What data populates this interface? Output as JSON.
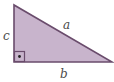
{
  "diagram": {
    "type": "right-triangle",
    "colors": {
      "fill": "#c8b4cc",
      "stroke": "#6a4c6c",
      "label": "#4a4a4a",
      "background": "#ffffff"
    },
    "vertices": {
      "top": [
        14,
        5
      ],
      "right_angle": [
        14,
        62
      ],
      "bottom_right": [
        112,
        62
      ]
    },
    "sides": {
      "hypotenuse": "a",
      "bottom": "b",
      "left": "c"
    },
    "right_angle_marker": {
      "size": 10,
      "dot": true
    }
  }
}
